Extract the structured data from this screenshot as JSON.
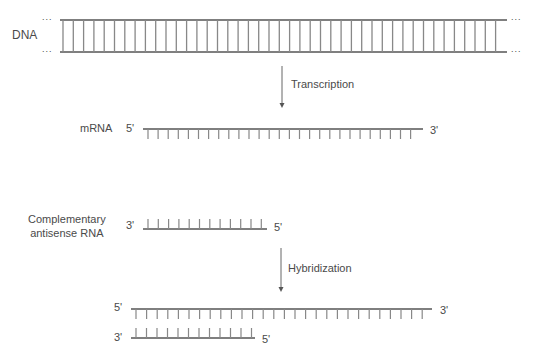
{
  "diagram": {
    "dna": {
      "label": "DNA",
      "ellipsis": "..."
    },
    "step1": {
      "label": "Transcription"
    },
    "mrna": {
      "label": "mRNA",
      "end_left": "5'",
      "end_right": "3'"
    },
    "antisense": {
      "label_line1": "Complementary",
      "label_line2": "antisense RNA",
      "end_left": "3'",
      "end_right": "5'"
    },
    "step2": {
      "label": "Hybridization"
    },
    "hybrid": {
      "top_left": "5'",
      "top_right": "3'",
      "bottom_left": "3'",
      "bottom_right": "5'"
    },
    "colors": {
      "line": "#555555",
      "rung": "#888888"
    }
  }
}
